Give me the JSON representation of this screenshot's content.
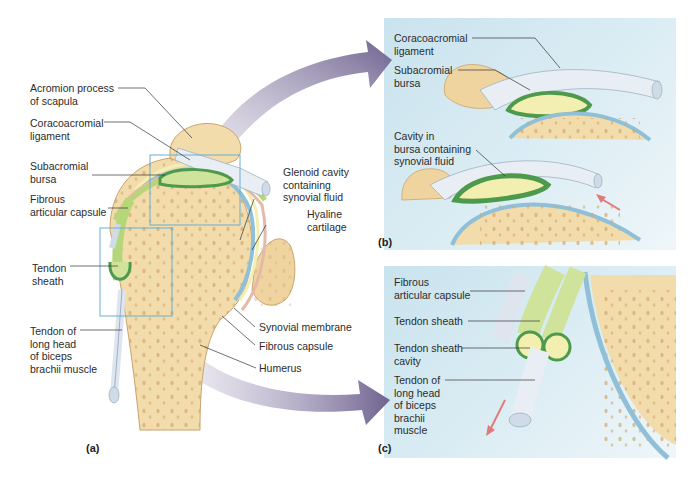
{
  "figure": {
    "panels": [
      {
        "id": "a",
        "tag": "(a)"
      },
      {
        "id": "b",
        "tag": "(b)"
      },
      {
        "id": "c",
        "tag": "(c)"
      }
    ]
  },
  "panel_a": {
    "labels": {
      "acromion": "Acromion process\nof scapula",
      "coracoacromial": "Coracoacromial\nligament",
      "subacromial": "Subacromial\nbursa",
      "fibrous_articular": "Fibrous\narticular capsule",
      "tendon_sheath": "Tendon\nsheath",
      "tendon_biceps": "Tendon of\nlong head\nof biceps\nbrachii muscle",
      "glenoid": "Glenoid cavity\ncontaining\nsynovial fluid",
      "hyaline": "Hyaline\ncartilage",
      "synovial_membrane": "Synovial membrane",
      "fibrous_capsule": "Fibrous capsule",
      "humerus": "Humerus"
    }
  },
  "panel_b": {
    "labels": {
      "coracoacromial": "Coracoacromial\nligament",
      "subacromial": "Subacromial\nbursa",
      "cavity": "Cavity in\nbursa containing\nsynovial fluid"
    }
  },
  "panel_c": {
    "labels": {
      "fibrous_articular": "Fibrous\narticular capsule",
      "tendon_sheath": "Tendon sheath",
      "sheath_cavity": "Tendon sheath\ncavity",
      "tendon_biceps": "Tendon of\nlong head\nof biceps\nbrachii\nmuscle"
    }
  },
  "colors": {
    "bone": "#f1d9a6",
    "bone_dots": "#d9b27a",
    "bursa_green": "#5fa055",
    "bursa_light": "#cfe39a",
    "cartilage_blue": "#8fc0d8",
    "ligament": "#e8eef4",
    "arrow_purple": "#7d6f9a",
    "motion_arrow": "#e07a7a",
    "panel_bg": "#d3e8f1",
    "zoom_box": "#6aaed0"
  }
}
